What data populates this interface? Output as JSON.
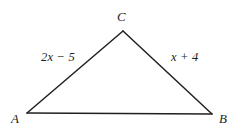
{
  "figure": {
    "type": "triangle-diagram",
    "background_color": "#ffffff",
    "stroke_color": "#231f20",
    "text_color": "#231f20",
    "stroke_width": 1.5,
    "vertices": [
      {
        "name": "C",
        "label": "C",
        "x": 123,
        "y": 31
      },
      {
        "name": "A",
        "label": "A",
        "x": 27,
        "y": 113
      },
      {
        "name": "B",
        "label": "B",
        "x": 212,
        "y": 114
      }
    ],
    "sides": [
      {
        "name": "side-ac",
        "from": "A",
        "to": "C",
        "label": "2x − 5"
      },
      {
        "name": "side-bc",
        "from": "B",
        "to": "C",
        "label": "x + 4"
      },
      {
        "name": "side-ab",
        "from": "A",
        "to": "B",
        "label": ""
      }
    ]
  }
}
